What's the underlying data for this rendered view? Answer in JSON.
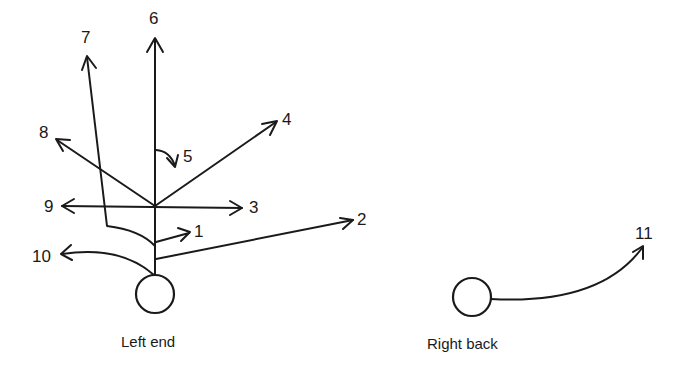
{
  "diagram": {
    "players": [
      {
        "id": "left-end",
        "label": "Left end"
      },
      {
        "id": "right-back",
        "label": "Right back"
      }
    ],
    "routes": [
      {
        "number": "1"
      },
      {
        "number": "2"
      },
      {
        "number": "3"
      },
      {
        "number": "4"
      },
      {
        "number": "5"
      },
      {
        "number": "6"
      },
      {
        "number": "7"
      },
      {
        "number": "8"
      },
      {
        "number": "9"
      },
      {
        "number": "10"
      },
      {
        "number": "11"
      }
    ],
    "colors": {
      "stroke": "#1a1a1a",
      "background": "#ffffff"
    }
  }
}
